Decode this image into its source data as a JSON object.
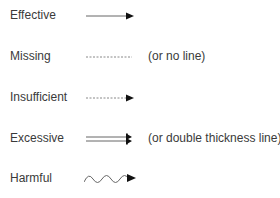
{
  "legend": {
    "items": [
      {
        "label": "Effective",
        "style": "solid-arrow",
        "note": ""
      },
      {
        "label": "Missing",
        "style": "dashed-no-arrow",
        "note": "(or no line)"
      },
      {
        "label": "Insufficient",
        "style": "dashed-arrow",
        "note": ""
      },
      {
        "label": "Excessive",
        "style": "double-arrow",
        "note": "(or double thickness line)"
      },
      {
        "label": "Harmful",
        "style": "wavy-arrow",
        "note": ""
      }
    ]
  },
  "colors": {
    "line": "#555555",
    "arrowhead": "#111111",
    "text": "#3a3a3a"
  }
}
